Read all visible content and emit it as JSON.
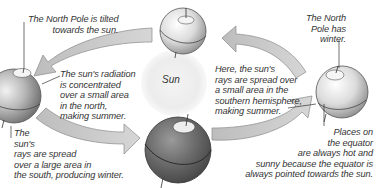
{
  "diagram": {
    "sun": {
      "label": "Sun",
      "color": "#f2f2f2"
    },
    "labels": {
      "north_pole_tilted": "The North Pole is tilted\n          towards the sun.",
      "radiation_concentrated": "The sun's radiation\nis concentrated\nover a small area\nin the north,\nmaking summer.",
      "rays_spread_south": "The\nsun's\nrays are spread\nover a large area in\nthe south, producing winter.",
      "north_pole_winter": "The North\nPole has\nwinter.",
      "southern_summer": "Here, the sun's\nrays are spread over\na small area in the\nsouthern hemisphere,\nmaking summer.",
      "equator": "Places on\nthe equator\nare always hot and\nsunny because the equator is\nalways pointed towards the sun."
    },
    "colors": {
      "arrow_fill": "#c8c8c8",
      "arrow_stroke": "#8a8a8a",
      "text": "#333333",
      "globe_dark": "#5a5a5a",
      "globe_light": "#f4f4f4"
    }
  }
}
